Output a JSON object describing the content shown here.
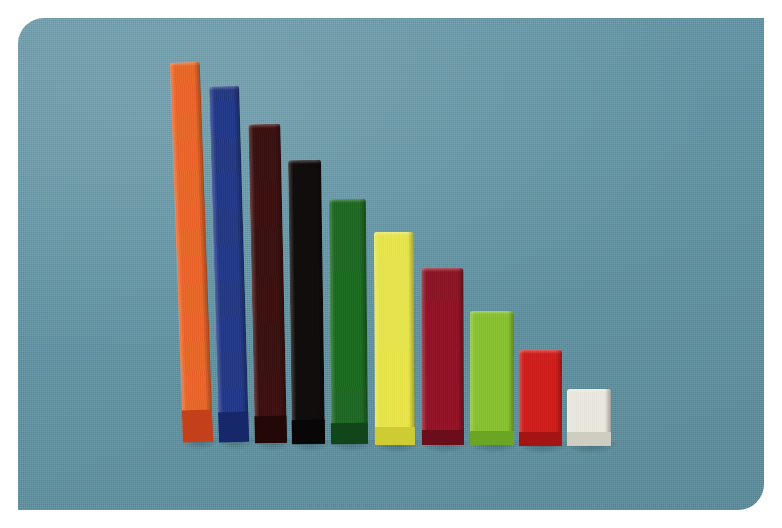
{
  "image": {
    "title": "Cuisenaire rods arranged as a descending staircase",
    "subject": "math-manipulative-rods",
    "background_color": "#5f93a4",
    "background_label": "teal blue woven cloth",
    "print_border_color": "#ffffff",
    "width_px": 782,
    "height_px": 528
  },
  "photo": {
    "surface_left": 18,
    "surface_top": 18,
    "surface_width": 746,
    "surface_height": 492,
    "rounded_corners": "top-left and bottom-right"
  },
  "chart_data": {
    "type": "bar",
    "xlabel": "",
    "ylabel": "Rod length (units)",
    "ylim": [
      0,
      10
    ],
    "grid": false,
    "legend": "none",
    "categories": [
      "orange",
      "blue",
      "brown",
      "black",
      "dark green",
      "yellow",
      "dark red",
      "light green",
      "red",
      "white"
    ],
    "values": [
      10,
      9,
      8,
      7,
      6,
      5,
      4,
      3,
      2,
      1
    ],
    "tick_labels": [
      "10",
      "9",
      "8",
      "7",
      "6",
      "5",
      "4",
      "3",
      "2",
      "1"
    ],
    "annotations": "Standard Cuisenaire rod set, longest at left descending to the unit cube at right"
  },
  "rods": [
    {
      "name": "orange-rod",
      "color_label": "orange",
      "length_units": 10,
      "hex": "#e8662a",
      "end_hex": "#c4401a",
      "x": 183,
      "y": 62,
      "w": 30,
      "h": 380,
      "tilt": -2.0
    },
    {
      "name": "blue-rod",
      "color_label": "blue",
      "length_units": 9,
      "hex": "#243a86",
      "end_hex": "#16276a",
      "x": 219,
      "y": 86,
      "w": 30,
      "h": 356,
      "tilt": -1.6
    },
    {
      "name": "brown-rod",
      "color_label": "brown",
      "length_units": 8,
      "hex": "#3d1212",
      "end_hex": "#230808",
      "x": 255,
      "y": 124,
      "w": 32,
      "h": 319,
      "tilt": -1.2
    },
    {
      "name": "black-rod",
      "color_label": "black",
      "length_units": 7,
      "hex": "#120d0d",
      "end_hex": "#080606",
      "x": 292,
      "y": 160,
      "w": 33,
      "h": 284,
      "tilt": -0.8
    },
    {
      "name": "dark-green-rod",
      "color_label": "dark green",
      "length_units": 6,
      "hex": "#1d6a22",
      "end_hex": "#10461a",
      "x": 331,
      "y": 199,
      "w": 37,
      "h": 245,
      "tilt": -0.5
    },
    {
      "name": "yellow-rod",
      "color_label": "yellow",
      "length_units": 5,
      "hex": "#e5e34a",
      "end_hex": "#cfcb33",
      "x": 375,
      "y": 232,
      "w": 40,
      "h": 213,
      "tilt": -0.3
    },
    {
      "name": "dark-red-rod",
      "color_label": "dark red",
      "length_units": 4,
      "hex": "#8e1526",
      "end_hex": "#6b0d1b",
      "x": 422,
      "y": 268,
      "w": 42,
      "h": 177,
      "tilt": -0.2
    },
    {
      "name": "light-green-rod",
      "color_label": "light green",
      "length_units": 3,
      "hex": "#84c132",
      "end_hex": "#6aa524",
      "x": 470,
      "y": 311,
      "w": 44,
      "h": 134,
      "tilt": 0
    },
    {
      "name": "red-rod",
      "color_label": "red",
      "length_units": 2,
      "hex": "#cf1e1b",
      "end_hex": "#a31412",
      "x": 519,
      "y": 350,
      "w": 43,
      "h": 96,
      "tilt": 0
    },
    {
      "name": "white-cube",
      "color_label": "white",
      "length_units": 1,
      "hex": "#e8e6dd",
      "end_hex": "#cfccc0",
      "x": 567,
      "y": 389,
      "w": 44,
      "h": 57,
      "tilt": 0
    }
  ]
}
